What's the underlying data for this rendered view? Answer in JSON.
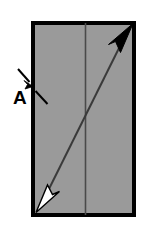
{
  "figure": {
    "background_color": "#ffffff"
  },
  "panel": {
    "name": "rectangular-panel",
    "fill_color": "#9a9a9a",
    "border_color": "#000000",
    "border_width_px": 4,
    "x": 31,
    "y": 21,
    "width": 105,
    "height": 196
  },
  "divider": {
    "name": "vertical-divider-line",
    "color": "#4a4a4a",
    "width_px": 1.6,
    "x": 85.5,
    "y_top": 23,
    "y_bottom": 215
  },
  "arrow": {
    "name": "diagonal-double-arrow",
    "line_color": "#3a3a3a",
    "line_width_px": 2.0,
    "start_x": 37,
    "start_y": 211,
    "end_x": 132,
    "end_y": 25,
    "head_top": {
      "name": "filled-arrowhead",
      "style": "solid",
      "fill_color": "#000000",
      "stroke_color": "#000000"
    },
    "head_bottom": {
      "name": "hollow-arrowhead",
      "style": "hollow",
      "fill_color": "#ffffff",
      "stroke_color": "#000000"
    }
  },
  "callout": {
    "name": "callout-a",
    "label": "A",
    "label_x": 13,
    "label_y": 104,
    "leader_color": "#000000",
    "leader_width_px": 2.0,
    "leader_style": "dashed",
    "target_x": 32,
    "target_y": 84,
    "segments": [
      {
        "x1": 19,
        "y1": 70,
        "x2": 29,
        "y2": 82
      },
      {
        "x1": 35,
        "y1": 90,
        "x2": 47,
        "y2": 103
      }
    ]
  }
}
